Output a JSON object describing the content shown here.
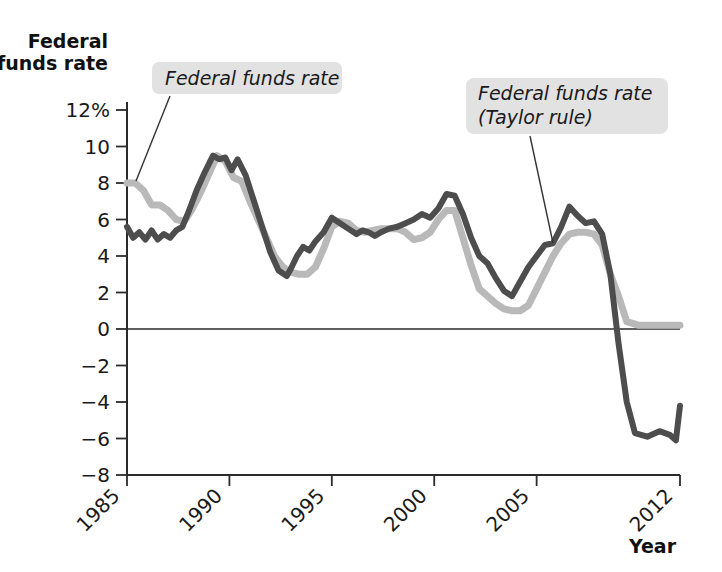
{
  "chart_data": {
    "type": "line",
    "title": "",
    "ylabel": "Federal funds rate",
    "xlabel": "Year",
    "ylim": [
      -8,
      12
    ],
    "xlim": [
      1985,
      2012
    ],
    "grid": false,
    "legend_position": "inline-annotations",
    "y_ticks": [
      "12%",
      "10",
      "8",
      "6",
      "4",
      "2",
      "0",
      "−2",
      "−4",
      "−6",
      "−8"
    ],
    "y_tick_values": [
      12,
      10,
      8,
      6,
      4,
      2,
      0,
      -2,
      -4,
      -6,
      -8
    ],
    "x_ticks": [
      "1985",
      "1990",
      "1995",
      "2000",
      "2005",
      "2012"
    ],
    "x_tick_values": [
      1985,
      1990,
      1995,
      2000,
      2005,
      2012
    ],
    "annotations": [
      {
        "name": "federal-funds-rate-label",
        "text": "Federal funds rate",
        "lines": [
          "Federal funds rate"
        ],
        "points_to": "actual"
      },
      {
        "name": "taylor-rule-label",
        "text": "Federal funds rate (Taylor rule)",
        "lines": [
          "Federal funds rate",
          "(Taylor rule)"
        ],
        "points_to": "taylor"
      }
    ],
    "colors": {
      "actual": "#b9b9b9",
      "taylor": "#4d4d4d",
      "axis": "#2b2b2b",
      "label_box": "#e2e2e2"
    },
    "series": [
      {
        "name": "Federal funds rate",
        "key": "actual",
        "color": "#b9b9b9",
        "x": [
          1985.0,
          1985.4,
          1985.8,
          1986.2,
          1986.6,
          1987.0,
          1987.4,
          1987.8,
          1988.2,
          1988.6,
          1989.0,
          1989.4,
          1989.8,
          1990.2,
          1990.6,
          1991.0,
          1991.4,
          1991.8,
          1992.2,
          1992.6,
          1993.0,
          1993.4,
          1993.8,
          1994.2,
          1994.6,
          1995.0,
          1995.4,
          1995.8,
          1996.2,
          1996.6,
          1997.0,
          1997.4,
          1997.8,
          1998.2,
          1998.6,
          1999.0,
          1999.4,
          1999.8,
          2000.2,
          2000.6,
          2001.0,
          2001.4,
          2001.8,
          2002.2,
          2002.6,
          2003.0,
          2003.4,
          2003.8,
          2004.2,
          2004.6,
          2005.0,
          2005.4,
          2005.8,
          2006.2,
          2006.6,
          2007.0,
          2007.4,
          2007.8,
          2008.2,
          2008.6,
          2009.0,
          2009.4,
          2010.0,
          2010.6,
          2011.2,
          2011.6,
          2012.0
        ],
        "y": [
          8.0,
          8.0,
          7.6,
          6.8,
          6.8,
          6.5,
          6.0,
          5.9,
          6.6,
          7.5,
          8.5,
          9.5,
          9.2,
          8.3,
          8.1,
          7.0,
          6.0,
          5.0,
          4.0,
          3.4,
          3.1,
          3.0,
          3.0,
          3.4,
          4.4,
          5.6,
          5.9,
          5.8,
          5.4,
          5.3,
          5.4,
          5.5,
          5.5,
          5.5,
          5.3,
          4.9,
          5.0,
          5.3,
          6.0,
          6.5,
          6.5,
          5.0,
          3.5,
          2.2,
          1.8,
          1.4,
          1.1,
          1.0,
          1.0,
          1.3,
          2.2,
          3.1,
          4.0,
          4.7,
          5.2,
          5.3,
          5.3,
          5.2,
          4.6,
          3.0,
          1.8,
          0.4,
          0.2,
          0.2,
          0.2,
          0.2,
          0.2
        ]
      },
      {
        "name": "Federal funds rate (Taylor rule)",
        "key": "taylor",
        "color": "#4d4d4d",
        "x": [
          1985.0,
          1985.3,
          1985.6,
          1985.9,
          1986.2,
          1986.5,
          1986.8,
          1987.1,
          1987.4,
          1987.7,
          1988.0,
          1988.4,
          1988.8,
          1989.2,
          1989.5,
          1989.8,
          1990.1,
          1990.4,
          1990.8,
          1991.2,
          1991.6,
          1992.0,
          1992.4,
          1992.8,
          1993.0,
          1993.3,
          1993.6,
          1993.9,
          1994.2,
          1994.6,
          1995.0,
          1995.4,
          1995.8,
          1996.2,
          1996.5,
          1996.8,
          1997.1,
          1997.4,
          1997.8,
          1998.2,
          1998.6,
          1999.0,
          1999.4,
          1999.8,
          2000.2,
          2000.6,
          2001.0,
          2001.4,
          2001.8,
          2002.2,
          2002.6,
          2003.0,
          2003.4,
          2003.8,
          2004.2,
          2004.6,
          2005.0,
          2005.4,
          2005.8,
          2006.2,
          2006.6,
          2007.0,
          2007.4,
          2007.8,
          2008.2,
          2008.6,
          2009.0,
          2009.4,
          2009.8,
          2010.4,
          2011.0,
          2011.5,
          2011.8,
          2012.0
        ],
        "y": [
          5.6,
          5.0,
          5.3,
          4.9,
          5.4,
          4.9,
          5.2,
          5.0,
          5.4,
          5.6,
          6.4,
          7.6,
          8.6,
          9.5,
          9.3,
          9.4,
          8.7,
          9.3,
          8.4,
          7.0,
          5.6,
          4.2,
          3.2,
          2.9,
          3.3,
          4.0,
          4.5,
          4.3,
          4.8,
          5.3,
          6.1,
          5.8,
          5.5,
          5.2,
          5.4,
          5.3,
          5.1,
          5.3,
          5.5,
          5.6,
          5.8,
          6.0,
          6.3,
          6.1,
          6.6,
          7.4,
          7.3,
          6.3,
          5.0,
          4.0,
          3.6,
          2.8,
          2.1,
          1.8,
          2.6,
          3.4,
          4.0,
          4.6,
          4.7,
          5.6,
          6.7,
          6.2,
          5.8,
          5.9,
          5.2,
          3.0,
          -0.8,
          -4.0,
          -5.7,
          -5.9,
          -5.6,
          -5.8,
          -6.1,
          -4.2
        ]
      }
    ]
  },
  "axis_titles": {
    "y_line1": "Federal",
    "y_line2": "funds rate",
    "x": "Year"
  }
}
